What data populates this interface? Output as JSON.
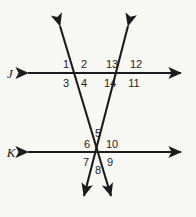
{
  "figure": {
    "type": "geometry-diagram",
    "background_color": "#f7f7f4",
    "stroke_color": "#1c1c1c",
    "text_color": "#1c1c1c",
    "width": 196,
    "height": 217
  },
  "lines": [
    {
      "id": "line-j",
      "label": "J",
      "label_x": 10,
      "label_y": 73,
      "orientation": "horizontal",
      "x1": 22,
      "y1": 73,
      "x2": 186,
      "y2": 73,
      "arrows": "both"
    },
    {
      "id": "line-k",
      "label": "K",
      "label_x": 11,
      "label_y": 152,
      "orientation": "horizontal",
      "x1": 22,
      "y1": 152,
      "x2": 186,
      "y2": 152,
      "arrows": "both"
    },
    {
      "id": "transversal-left",
      "label": "",
      "orientation": "diagonal",
      "x1": 57,
      "y1": 18,
      "x2": 114,
      "y2": 203,
      "arrows": "both"
    },
    {
      "id": "transversal-right",
      "label": "",
      "orientation": "diagonal",
      "x1": 130,
      "y1": 18,
      "x2": 81,
      "y2": 203,
      "arrows": "both"
    }
  ],
  "angle_labels": [
    {
      "id": "angle-1",
      "text": "1",
      "x": 66,
      "y": 64
    },
    {
      "id": "angle-2",
      "text": "2",
      "x": 84,
      "y": 64
    },
    {
      "id": "angle-13",
      "text": "13",
      "x": 112,
      "y": 64
    },
    {
      "id": "angle-12",
      "text": "12",
      "x": 136,
      "y": 64
    },
    {
      "id": "angle-3",
      "text": "3",
      "x": 66,
      "y": 83
    },
    {
      "id": "angle-4",
      "text": "4",
      "x": 84,
      "y": 83
    },
    {
      "id": "angle-14",
      "text": "14",
      "x": 110,
      "y": 83
    },
    {
      "id": "angle-11",
      "text": "11",
      "x": 134,
      "y": 83
    },
    {
      "id": "angle-5",
      "text": "5",
      "x": 98,
      "y": 133
    },
    {
      "id": "angle-6",
      "text": "6",
      "x": 87,
      "y": 144
    },
    {
      "id": "angle-10",
      "text": "10",
      "x": 112,
      "y": 144
    },
    {
      "id": "angle-7",
      "text": "7",
      "x": 86,
      "y": 162
    },
    {
      "id": "angle-9",
      "text": "9",
      "x": 110,
      "y": 162
    },
    {
      "id": "angle-8",
      "text": "8",
      "x": 98,
      "y": 170
    }
  ]
}
